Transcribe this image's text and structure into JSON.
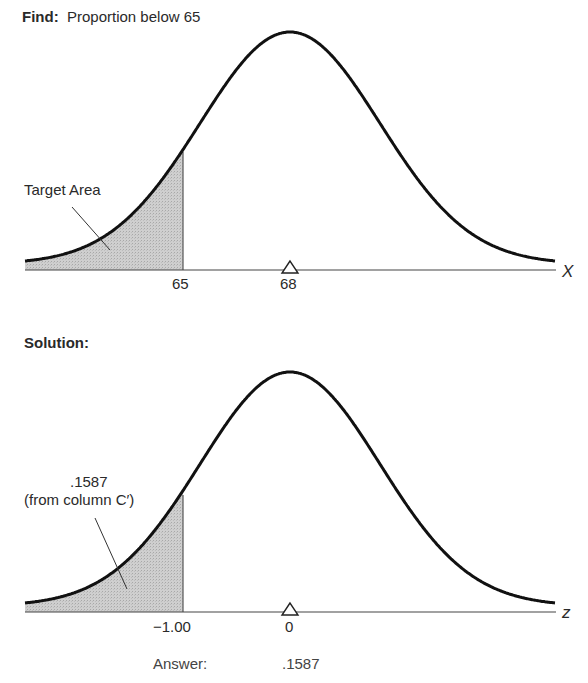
{
  "top": {
    "find_label": "Find:",
    "find_text": "Proportion below 65",
    "area_label": "Target Area",
    "cutoff_tick": "65",
    "mean_tick": "68",
    "axis_variable": "X"
  },
  "bottom": {
    "solution_label": "Solution:",
    "area_value": ".1587",
    "area_source": "(from column C′)",
    "cutoff_tick": "−1.00",
    "mean_tick": "0",
    "axis_variable": "z",
    "answer_label": "Answer:",
    "answer_value": ".1587"
  },
  "colors": {
    "curve": "#111111",
    "axis": "#444444",
    "shade": "#c9c9c9",
    "text": "#2a2a2a"
  },
  "chart_data": [
    {
      "type": "area",
      "title": "Find: Proportion below 65",
      "distribution": "normal",
      "xlabel": "X",
      "mean": 68,
      "tick_labels": [
        "65",
        "68"
      ],
      "shaded_region": {
        "from": "-inf",
        "to": 65,
        "label": "Target Area"
      },
      "mean_marker": "triangle"
    },
    {
      "type": "area",
      "title": "Solution:",
      "distribution": "standard normal",
      "xlabel": "z",
      "mean": 0,
      "tick_labels": [
        "-1.00",
        "0"
      ],
      "shaded_region": {
        "from": "-inf",
        "to": -1.0,
        "label": ".1587 (from column C')",
        "value": 0.1587
      },
      "mean_marker": "triangle",
      "answer": 0.1587
    }
  ]
}
